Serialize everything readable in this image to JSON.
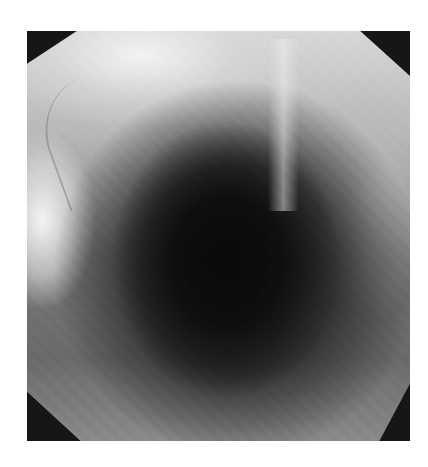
{
  "image": {
    "description": "Grayscale endoscopic view of a luminal cavity within an octagonal frame",
    "colors": {
      "frame_corners": "#161616",
      "lumen_center": "#0a0a0a",
      "mucosa_light": "#e8e8e8",
      "background": "#ffffff"
    }
  }
}
